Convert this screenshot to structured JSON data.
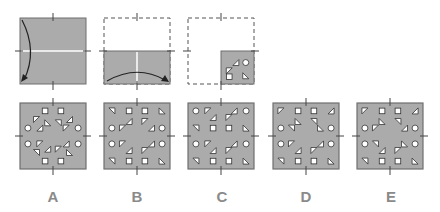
{
  "colors": {
    "paper": "#ababab",
    "edge": "#6f6f6f",
    "fold": "#ffffff",
    "dash": "#555555",
    "tick": "#444444",
    "arrow": "#222222",
    "label": "#8a8a8a"
  },
  "size": 66,
  "steps": [
    {
      "x": 20,
      "y": 18,
      "type": "full-fold-h"
    },
    {
      "x": 104,
      "y": 18,
      "type": "half-fold-v"
    },
    {
      "x": 188,
      "y": 18,
      "type": "quarter-punched"
    }
  ],
  "punched_quarter": [
    {
      "shape": "tri",
      "fx": 0.45,
      "fy": 0.35,
      "rot": 0
    },
    {
      "shape": "circle",
      "fx": 0.75,
      "fy": 0.35
    },
    {
      "shape": "tri",
      "fx": 0.25,
      "fy": 0.6,
      "rot": 180
    },
    {
      "shape": "square",
      "fx": 0.25,
      "fy": 0.78
    },
    {
      "shape": "tri",
      "fx": 0.75,
      "fy": 0.75,
      "rot": 90
    }
  ],
  "options": [
    {
      "label": "A",
      "x": 20,
      "items": [
        {
          "s": "square",
          "fx": 0.38,
          "fy": 0.12
        },
        {
          "s": "square",
          "fx": 0.62,
          "fy": 0.12
        },
        {
          "s": "tri",
          "fx": 0.25,
          "fy": 0.25,
          "r": 180
        },
        {
          "s": "tri",
          "fx": 0.75,
          "fy": 0.25,
          "r": 0
        },
        {
          "s": "tri",
          "fx": 0.42,
          "fy": 0.3,
          "r": 90
        },
        {
          "s": "tri",
          "fx": 0.58,
          "fy": 0.3,
          "r": 270
        },
        {
          "s": "circle",
          "fx": 0.12,
          "fy": 0.38
        },
        {
          "s": "tri",
          "fx": 0.3,
          "fy": 0.38,
          "r": 0
        },
        {
          "s": "tri",
          "fx": 0.7,
          "fy": 0.38,
          "r": 180
        },
        {
          "s": "circle",
          "fx": 0.88,
          "fy": 0.38
        },
        {
          "s": "circle",
          "fx": 0.12,
          "fy": 0.62
        },
        {
          "s": "tri",
          "fx": 0.3,
          "fy": 0.62,
          "r": 180
        },
        {
          "s": "tri",
          "fx": 0.7,
          "fy": 0.62,
          "r": 0
        },
        {
          "s": "circle",
          "fx": 0.88,
          "fy": 0.62
        },
        {
          "s": "tri",
          "fx": 0.42,
          "fy": 0.7,
          "r": 0
        },
        {
          "s": "tri",
          "fx": 0.58,
          "fy": 0.7,
          "r": 180
        },
        {
          "s": "tri",
          "fx": 0.25,
          "fy": 0.75,
          "r": 270
        },
        {
          "s": "tri",
          "fx": 0.75,
          "fy": 0.75,
          "r": 90
        },
        {
          "s": "square",
          "fx": 0.38,
          "fy": 0.88
        },
        {
          "s": "square",
          "fx": 0.62,
          "fy": 0.88
        }
      ]
    },
    {
      "label": "B",
      "x": 104,
      "items": [
        {
          "s": "tri",
          "fx": 0.12,
          "fy": 0.12,
          "r": 270
        },
        {
          "s": "square",
          "fx": 0.38,
          "fy": 0.12
        },
        {
          "s": "square",
          "fx": 0.62,
          "fy": 0.12
        },
        {
          "s": "tri",
          "fx": 0.88,
          "fy": 0.12,
          "r": 90
        },
        {
          "s": "tri",
          "fx": 0.38,
          "fy": 0.28,
          "r": 0
        },
        {
          "s": "tri",
          "fx": 0.62,
          "fy": 0.28,
          "r": 180
        },
        {
          "s": "circle",
          "fx": 0.12,
          "fy": 0.38
        },
        {
          "s": "tri",
          "fx": 0.28,
          "fy": 0.38,
          "r": 180
        },
        {
          "s": "tri",
          "fx": 0.72,
          "fy": 0.38,
          "r": 0
        },
        {
          "s": "circle",
          "fx": 0.88,
          "fy": 0.38
        },
        {
          "s": "circle",
          "fx": 0.12,
          "fy": 0.62
        },
        {
          "s": "tri",
          "fx": 0.28,
          "fy": 0.62,
          "r": 180
        },
        {
          "s": "tri",
          "fx": 0.72,
          "fy": 0.62,
          "r": 0
        },
        {
          "s": "circle",
          "fx": 0.88,
          "fy": 0.62
        },
        {
          "s": "tri",
          "fx": 0.38,
          "fy": 0.72,
          "r": 0
        },
        {
          "s": "tri",
          "fx": 0.62,
          "fy": 0.72,
          "r": 180
        },
        {
          "s": "tri",
          "fx": 0.12,
          "fy": 0.88,
          "r": 270
        },
        {
          "s": "square",
          "fx": 0.38,
          "fy": 0.88
        },
        {
          "s": "square",
          "fx": 0.62,
          "fy": 0.88
        },
        {
          "s": "tri",
          "fx": 0.88,
          "fy": 0.88,
          "r": 90
        }
      ]
    },
    {
      "label": "C",
      "x": 188,
      "items": [
        {
          "s": "circle",
          "fx": 0.12,
          "fy": 0.12
        },
        {
          "s": "tri",
          "fx": 0.3,
          "fy": 0.12,
          "r": 180
        },
        {
          "s": "tri",
          "fx": 0.7,
          "fy": 0.12,
          "r": 0
        },
        {
          "s": "circle",
          "fx": 0.88,
          "fy": 0.12
        },
        {
          "s": "tri",
          "fx": 0.38,
          "fy": 0.22,
          "r": 0
        },
        {
          "s": "tri",
          "fx": 0.62,
          "fy": 0.22,
          "r": 180
        },
        {
          "s": "tri",
          "fx": 0.12,
          "fy": 0.38,
          "r": 270
        },
        {
          "s": "square",
          "fx": 0.38,
          "fy": 0.38
        },
        {
          "s": "square",
          "fx": 0.62,
          "fy": 0.38
        },
        {
          "s": "tri",
          "fx": 0.88,
          "fy": 0.38,
          "r": 90
        },
        {
          "s": "circle",
          "fx": 0.12,
          "fy": 0.62
        },
        {
          "s": "tri",
          "fx": 0.3,
          "fy": 0.62,
          "r": 180
        },
        {
          "s": "tri",
          "fx": 0.7,
          "fy": 0.62,
          "r": 0
        },
        {
          "s": "circle",
          "fx": 0.88,
          "fy": 0.62
        },
        {
          "s": "tri",
          "fx": 0.38,
          "fy": 0.72,
          "r": 0
        },
        {
          "s": "tri",
          "fx": 0.62,
          "fy": 0.72,
          "r": 180
        },
        {
          "s": "tri",
          "fx": 0.12,
          "fy": 0.88,
          "r": 270
        },
        {
          "s": "square",
          "fx": 0.38,
          "fy": 0.88
        },
        {
          "s": "square",
          "fx": 0.62,
          "fy": 0.88
        },
        {
          "s": "tri",
          "fx": 0.88,
          "fy": 0.88,
          "r": 90
        }
      ]
    },
    {
      "label": "D",
      "x": 273,
      "items": [
        {
          "s": "tri",
          "fx": 0.12,
          "fy": 0.12,
          "r": 180
        },
        {
          "s": "square",
          "fx": 0.38,
          "fy": 0.12
        },
        {
          "s": "square",
          "fx": 0.62,
          "fy": 0.12
        },
        {
          "s": "tri",
          "fx": 0.88,
          "fy": 0.12,
          "r": 0
        },
        {
          "s": "tri",
          "fx": 0.38,
          "fy": 0.28,
          "r": 90
        },
        {
          "s": "tri",
          "fx": 0.62,
          "fy": 0.28,
          "r": 270
        },
        {
          "s": "circle",
          "fx": 0.12,
          "fy": 0.38
        },
        {
          "s": "tri",
          "fx": 0.28,
          "fy": 0.38,
          "r": 270
        },
        {
          "s": "tri",
          "fx": 0.72,
          "fy": 0.38,
          "r": 90
        },
        {
          "s": "circle",
          "fx": 0.88,
          "fy": 0.38
        },
        {
          "s": "circle",
          "fx": 0.12,
          "fy": 0.62
        },
        {
          "s": "tri",
          "fx": 0.28,
          "fy": 0.62,
          "r": 180
        },
        {
          "s": "tri",
          "fx": 0.72,
          "fy": 0.62,
          "r": 0
        },
        {
          "s": "circle",
          "fx": 0.88,
          "fy": 0.62
        },
        {
          "s": "tri",
          "fx": 0.38,
          "fy": 0.72,
          "r": 0
        },
        {
          "s": "tri",
          "fx": 0.62,
          "fy": 0.72,
          "r": 180
        },
        {
          "s": "tri",
          "fx": 0.12,
          "fy": 0.88,
          "r": 270
        },
        {
          "s": "square",
          "fx": 0.38,
          "fy": 0.88
        },
        {
          "s": "square",
          "fx": 0.62,
          "fy": 0.88
        },
        {
          "s": "tri",
          "fx": 0.88,
          "fy": 0.88,
          "r": 90
        }
      ]
    },
    {
      "label": "E",
      "x": 357,
      "items": [
        {
          "s": "tri",
          "fx": 0.12,
          "fy": 0.12,
          "r": 180
        },
        {
          "s": "square",
          "fx": 0.38,
          "fy": 0.12
        },
        {
          "s": "square",
          "fx": 0.62,
          "fy": 0.12
        },
        {
          "s": "tri",
          "fx": 0.88,
          "fy": 0.12,
          "r": 0
        },
        {
          "s": "tri",
          "fx": 0.38,
          "fy": 0.28,
          "r": 90
        },
        {
          "s": "tri",
          "fx": 0.62,
          "fy": 0.28,
          "r": 270
        },
        {
          "s": "circle",
          "fx": 0.12,
          "fy": 0.38
        },
        {
          "s": "tri",
          "fx": 0.28,
          "fy": 0.38,
          "r": 180
        },
        {
          "s": "tri",
          "fx": 0.72,
          "fy": 0.38,
          "r": 0
        },
        {
          "s": "circle",
          "fx": 0.88,
          "fy": 0.38
        },
        {
          "s": "circle",
          "fx": 0.12,
          "fy": 0.62
        },
        {
          "s": "tri",
          "fx": 0.28,
          "fy": 0.62,
          "r": 270
        },
        {
          "s": "tri",
          "fx": 0.72,
          "fy": 0.62,
          "r": 90
        },
        {
          "s": "circle",
          "fx": 0.88,
          "fy": 0.62
        },
        {
          "s": "tri",
          "fx": 0.38,
          "fy": 0.72,
          "r": 0
        },
        {
          "s": "tri",
          "fx": 0.62,
          "fy": 0.72,
          "r": 180
        },
        {
          "s": "tri",
          "fx": 0.12,
          "fy": 0.88,
          "r": 270
        },
        {
          "s": "square",
          "fx": 0.38,
          "fy": 0.88
        },
        {
          "s": "square",
          "fx": 0.62,
          "fy": 0.88
        },
        {
          "s": "tri",
          "fx": 0.88,
          "fy": 0.88,
          "r": 90
        }
      ]
    }
  ],
  "option_row_y": 103,
  "labels": {
    "a": "A",
    "b": "B",
    "c": "C",
    "d": "D",
    "e": "E"
  }
}
